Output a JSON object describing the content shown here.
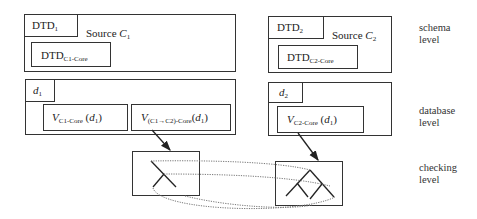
{
  "sources": [
    {
      "dtd": {
        "base": "DTD",
        "sub": "1"
      },
      "source_label": {
        "text": "Source ",
        "var": "C",
        "sub": "1"
      },
      "core_dtd": {
        "base": "DTD",
        "sub": "C1-Core"
      },
      "db": {
        "var": "d",
        "sub": "1"
      },
      "views": [
        {
          "var": "V",
          "sub": "C1-Core",
          "arg_var": "d",
          "arg_sub": "1"
        },
        {
          "var": "V",
          "sub": "(C1→C2)-Core",
          "arg_var": "d",
          "arg_sub": "1"
        }
      ]
    },
    {
      "dtd": {
        "base": "DTD",
        "sub": "2"
      },
      "source_label": {
        "text": "Source ",
        "var": "C",
        "sub": "2"
      },
      "core_dtd": {
        "base": "DTD",
        "sub": "C2-Core"
      },
      "db": {
        "var": "d",
        "sub": "2"
      },
      "views": [
        {
          "var": "V",
          "sub": "C2-Core",
          "arg_var": "d",
          "arg_sub": "1"
        }
      ]
    }
  ],
  "levels": {
    "schema": [
      "schema",
      "level"
    ],
    "database": [
      "database",
      "level"
    ],
    "checking": [
      "checking",
      "level"
    ]
  }
}
